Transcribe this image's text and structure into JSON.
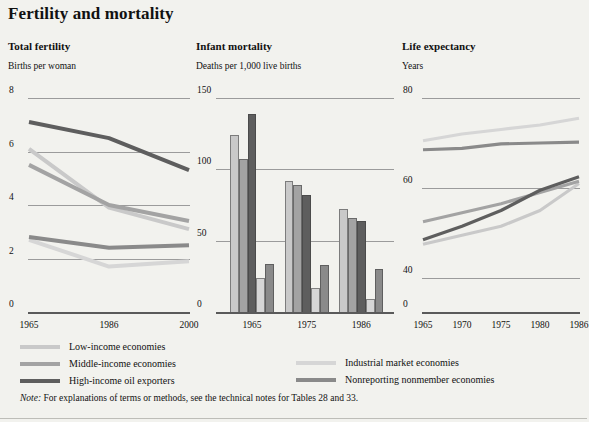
{
  "page": {
    "title": "Fertility and mortality",
    "note_prefix": "Note:",
    "note_text": "For explanations of terms or methods, see the technical notes for Tables 28 and 33."
  },
  "series_colors": {
    "low_income": "#c9c9c9",
    "middle_income": "#a3a3a3",
    "high_income_oil": "#5e5e5e",
    "industrial_market": "#d6d6d6",
    "nonreporting_nonmember": "#8a8a8a"
  },
  "legend": {
    "columns": [
      {
        "items": [
          {
            "label": "Low-income economies",
            "color": "#c9c9c9"
          },
          {
            "label": "Middle-income economies",
            "color": "#a3a3a3"
          },
          {
            "label": "High-income oil exporters",
            "color": "#5e5e5e"
          }
        ]
      },
      {
        "items": [
          {
            "label": "Industrial market economies",
            "color": "#d6d6d6"
          },
          {
            "label": "Nonreporting nonmember economies",
            "color": "#8a8a8a"
          }
        ]
      }
    ]
  },
  "chart_data": [
    {
      "type": "line",
      "title": "Total fertility",
      "ylabel": "Births per woman",
      "xlabel": "",
      "x": [
        "1965",
        "1986",
        "2000"
      ],
      "yticks": [
        0,
        2,
        4,
        6,
        8
      ],
      "ylim": [
        0,
        8
      ],
      "grid": true,
      "series": [
        {
          "name": "Low-income economies",
          "color": "#c9c9c9",
          "values": [
            6.1,
            3.9,
            3.1
          ]
        },
        {
          "name": "Middle-income economies",
          "color": "#a3a3a3",
          "values": [
            5.5,
            4.0,
            3.4
          ]
        },
        {
          "name": "High-income oil exporters",
          "color": "#5e5e5e",
          "values": [
            7.1,
            6.5,
            5.3
          ]
        },
        {
          "name": "Industrial market economies",
          "color": "#d6d6d6",
          "values": [
            2.7,
            1.7,
            1.9
          ]
        },
        {
          "name": "Nonreporting nonmember economies",
          "color": "#8a8a8a",
          "values": [
            2.8,
            2.4,
            2.5
          ]
        }
      ]
    },
    {
      "type": "bar",
      "title": "Infant mortality",
      "ylabel": "Deaths per 1,000 live births",
      "xlabel": "",
      "categories": [
        "1965",
        "1975",
        "1986"
      ],
      "yticks": [
        0,
        50,
        100,
        150
      ],
      "ylim": [
        0,
        150
      ],
      "grid": true,
      "series": [
        {
          "name": "Low-income economies",
          "color": "#c9c9c9",
          "values": [
            124,
            92,
            72
          ]
        },
        {
          "name": "Middle-income economies",
          "color": "#a3a3a3",
          "values": [
            107,
            89,
            66
          ]
        },
        {
          "name": "High-income oil exporters",
          "color": "#5e5e5e",
          "values": [
            139,
            82,
            64
          ]
        },
        {
          "name": "Industrial market economies",
          "color": "#d6d6d6",
          "values": [
            24,
            17,
            9
          ]
        },
        {
          "name": "Nonreporting nonmember economies",
          "color": "#8a8a8a",
          "values": [
            34,
            33,
            30
          ]
        }
      ]
    },
    {
      "type": "line",
      "title": "Life expectancy",
      "ylabel": "Years",
      "xlabel": "",
      "x": [
        "1965",
        "1970",
        "1975",
        "1980",
        "1986"
      ],
      "yticks": [
        0,
        40,
        60,
        80
      ],
      "ylim": [
        0,
        80
      ],
      "axis_break": true,
      "grid": true,
      "series": [
        {
          "name": "Low-income economies",
          "color": "#c9c9c9",
          "values": [
            47.5,
            49.5,
            51.5,
            55.0,
            61.0
          ]
        },
        {
          "name": "Middle-income economies",
          "color": "#a3a3a3",
          "values": [
            52.5,
            54.5,
            56.5,
            59.0,
            61.5
          ]
        },
        {
          "name": "High-income oil exporters",
          "color": "#5e5e5e",
          "values": [
            48.5,
            51.5,
            55.0,
            59.5,
            62.5
          ]
        },
        {
          "name": "Industrial market economies",
          "color": "#d6d6d6",
          "values": [
            70.5,
            72.0,
            73.0,
            74.0,
            75.5
          ]
        },
        {
          "name": "Nonreporting nonmember economies",
          "color": "#8a8a8a",
          "values": [
            68.5,
            68.8,
            69.8,
            70.0,
            70.2
          ]
        }
      ]
    }
  ]
}
